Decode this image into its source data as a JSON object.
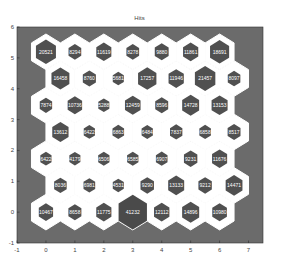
{
  "chart_data": {
    "type": "heatmap",
    "subtype": "som-hits-hexagonal",
    "title": "Hits",
    "xlabel": "",
    "ylabel": "",
    "xlim": [
      -1,
      7.5
    ],
    "ylim": [
      -1,
      6
    ],
    "xticks": [
      -1,
      0,
      1,
      2,
      3,
      4,
      5,
      6,
      7
    ],
    "yticks": [
      -1,
      0,
      1,
      2,
      3,
      4,
      5,
      6
    ],
    "grid": false,
    "grid_size": [
      7,
      7
    ],
    "colors": {
      "background": "#6b6b6b",
      "cell_outline": "#ffffff",
      "hit_fill": "#505050",
      "max_hit_fill": "#4a4a4a",
      "label": "#ffffff"
    },
    "rows": [
      {
        "row": 0,
        "y": 0.0,
        "x_offset": 0.0,
        "values": [
          10467,
          8658,
          11775,
          41232,
          12112,
          14896,
          10980
        ]
      },
      {
        "row": 1,
        "y": 0.866,
        "x_offset": 0.5,
        "values": [
          8036,
          6981,
          4531,
          9290,
          13133,
          9212,
          14471
        ]
      },
      {
        "row": 2,
        "y": 1.732,
        "x_offset": 0.0,
        "values": [
          6422,
          4179,
          6506,
          6585,
          6907,
          9231,
          11676
        ]
      },
      {
        "row": 3,
        "y": 2.598,
        "x_offset": 0.5,
        "values": [
          13612,
          6422,
          6863,
          6484,
          7837,
          6858,
          8517
        ]
      },
      {
        "row": 4,
        "y": 3.464,
        "x_offset": 0.0,
        "values": [
          7874,
          10736,
          5288,
          12459,
          8596,
          14728,
          13153
        ]
      },
      {
        "row": 5,
        "y": 4.33,
        "x_offset": 0.5,
        "values": [
          16458,
          8760,
          5681,
          17257,
          11946,
          21457,
          8097
        ]
      },
      {
        "row": 6,
        "y": 5.196,
        "x_offset": 0.0,
        "values": [
          20521,
          8294,
          11619,
          8278,
          9880,
          11861,
          18691
        ]
      }
    ]
  }
}
